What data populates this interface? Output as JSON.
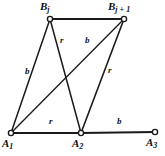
{
  "figure": {
    "type": "graph-diagram",
    "background_color": "#ffffff",
    "stroke_color": "#1a1a1a",
    "vertices": [
      {
        "id": "Bj",
        "name": "B",
        "subscript": "j",
        "x": 50,
        "y": 19,
        "label_x": 40,
        "label_y": 1,
        "label_text": "B"
      },
      {
        "id": "Bj1",
        "name": "B",
        "subscript": "j + 1",
        "x": 124,
        "y": 19,
        "label_x": 110,
        "label_y": 1,
        "label_text": "B"
      },
      {
        "id": "A1",
        "name": "A",
        "subscript": "1",
        "x": 11,
        "y": 133,
        "label_x": 2,
        "label_y": 139,
        "label_text": "A"
      },
      {
        "id": "A2",
        "name": "A",
        "subscript": "2",
        "x": 81,
        "y": 133,
        "label_x": 72,
        "label_y": 139,
        "label_text": "A"
      },
      {
        "id": "A3",
        "name": "A",
        "subscript": "3",
        "x": 155,
        "y": 132,
        "label_x": 146,
        "label_y": 139,
        "label_text": "A"
      }
    ],
    "edges": [
      {
        "id": "e-bj-bj1",
        "from": "Bj",
        "to": "Bj1",
        "label": "",
        "label_x": 0,
        "label_y": 0
      },
      {
        "id": "e-a1-bj",
        "from": "A1",
        "to": "Bj",
        "label": "b",
        "label_x": 25,
        "label_y": 67
      },
      {
        "id": "e-bj-a2",
        "from": "Bj",
        "to": "A2",
        "label": "r",
        "label_x": 60,
        "label_y": 36
      },
      {
        "id": "e-a1-bj1",
        "from": "A1",
        "to": "Bj1",
        "label": "b",
        "label_x": 85,
        "label_y": 36
      },
      {
        "id": "e-a2-bj1",
        "from": "A2",
        "to": "Bj1",
        "label": "r",
        "label_x": 108,
        "label_y": 66
      },
      {
        "id": "e-a1-a2",
        "from": "A1",
        "to": "A2",
        "label": "r",
        "label_x": 49,
        "label_y": 117
      },
      {
        "id": "e-a2-a3",
        "from": "A2",
        "to": "A3",
        "label": "b",
        "label_x": 117,
        "label_y": 117
      }
    ],
    "labels": {
      "Bj": "B",
      "Bj1": "B",
      "A1": "A",
      "A2": "A",
      "A3": "A",
      "sub_Bj": "j",
      "sub_Bj1": "j + 1",
      "sub_A1": "1",
      "sub_A2": "2",
      "sub_A3": "3",
      "edge_b": "b",
      "edge_r": "r"
    }
  }
}
